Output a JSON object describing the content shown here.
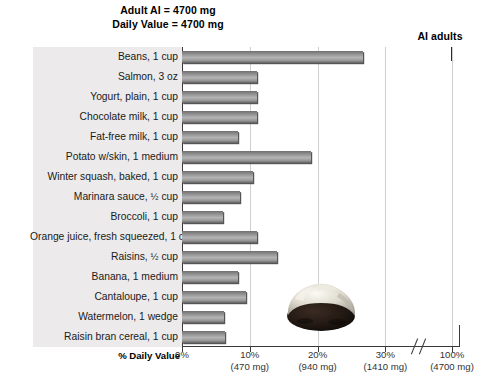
{
  "notes": {
    "adult_ai": "Adult AI = 4700 mg",
    "daily_value": "Daily Value = 4700 mg",
    "ai_adults": "AI adults"
  },
  "axis": {
    "title": "% Daily Value",
    "ticks": [
      {
        "percent": "0%",
        "mg": ""
      },
      {
        "percent": "10%",
        "mg": "(470 mg)"
      },
      {
        "percent": "20%",
        "mg": "(940 mg)"
      },
      {
        "percent": "30%",
        "mg": "(1410 mg)"
      },
      {
        "percent": "100%",
        "mg": "(4700 mg)"
      }
    ]
  },
  "photo": {
    "name": "baked-potato-photo",
    "alt": "Baked potato with white topping"
  },
  "chart_data": {
    "type": "bar",
    "orientation": "horizontal",
    "title": "",
    "xlabel": "% Daily Value",
    "ylabel": "",
    "xlim": [
      0,
      30
    ],
    "grid": true,
    "axis_break": true,
    "nutrient": "Potassium",
    "adult_ai_mg": 4700,
    "daily_value_mg": 4700,
    "categories": [
      "Beans, 1 cup",
      "Salmon, 3 oz",
      "Yogurt, plain, 1 cup",
      "Chocolate milk, 1 cup",
      "Fat-free milk, 1 cup",
      "Potato w/skin, 1 medium",
      "Winter squash, baked, 1 cup",
      "Marinara sauce, ½ cup",
      "Broccoli, 1 cup",
      "Orange juice,  fresh squeezed, 1 cup",
      "Raisins, ½ cup",
      "Banana, 1 medium",
      "Cantaloupe, 1 cup",
      "Watermelon, 1 wedge",
      "Raisin bran cereal, 1 cup"
    ],
    "values": [
      26.7,
      11.1,
      11.1,
      11.1,
      8.2,
      19.1,
      10.5,
      8.6,
      6.0,
      11.1,
      14.0,
      8.3,
      9.5,
      6.2,
      6.4
    ],
    "value_unit": "% Daily Value"
  }
}
